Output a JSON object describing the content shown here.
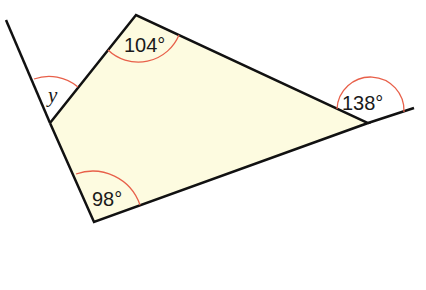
{
  "diagram": {
    "type": "quadrilateral-angles",
    "fill_color": "#fdfbe0",
    "line_color": "#111111",
    "arc_color": "#e8604a",
    "angles": [
      {
        "id": "top",
        "label": "104°",
        "kind": "interior"
      },
      {
        "id": "bottom",
        "label": "98°",
        "kind": "interior"
      },
      {
        "id": "right",
        "label": "138°",
        "kind": "exterior"
      },
      {
        "id": "left",
        "label": "y",
        "kind": "exterior"
      }
    ]
  }
}
